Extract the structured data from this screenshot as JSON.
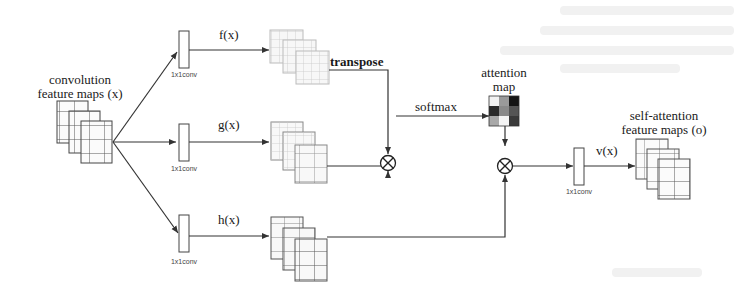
{
  "labels": {
    "input_title_line1": "convolution",
    "input_title_line2": "feature maps (x)",
    "f": "f(x)",
    "g": "g(x)",
    "h": "h(x)",
    "v": "v(x)",
    "transpose": "transpose",
    "softmax": "softmax",
    "attention_line1": "attention",
    "attention_line2": "map",
    "output_line1": "self-attention",
    "output_line2": "feature maps (o)",
    "conv_f": "1x1conv",
    "conv_g": "1x1conv",
    "conv_h": "1x1conv",
    "conv_v": "1x1conv"
  },
  "operators": {
    "multiply_top": "⊗",
    "multiply_bottom": "⊗"
  },
  "attention_map": {
    "cells": [
      "#f2f2f2",
      "#9a9a9a",
      "#151515",
      "#2a2a2a",
      "#8a8a8a",
      "#555555",
      "#a8a8a8",
      "#f5f5f5",
      "#3a3a3a"
    ]
  }
}
